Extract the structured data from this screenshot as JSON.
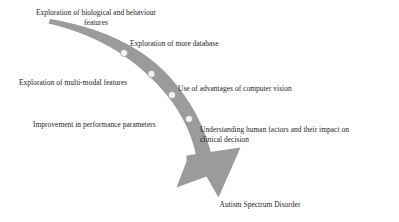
{
  "diagram": {
    "type": "curved-arrow-process",
    "colors": {
      "arrow_band": "#9b9b9b",
      "arrow_band_light": "#b0b0b0",
      "marker_fill": "#f2f2f2",
      "marker_stroke": "#8f8f8f",
      "text": "#1c1c1c",
      "background": "#ffffff"
    },
    "steps": [
      {
        "id": "step-1",
        "label": "Exploration of biological and behaviour\nfeatures",
        "align": "centered",
        "marker": false
      },
      {
        "id": "step-2",
        "label": "Exploration of more database",
        "align": "left",
        "marker": true
      },
      {
        "id": "step-3",
        "label": "Exploration of multi-modal features",
        "align": "left",
        "marker": true
      },
      {
        "id": "step-4",
        "label": "Use of advantages of computer vision",
        "align": "left",
        "marker": true
      },
      {
        "id": "step-5",
        "label": "Improvement in performance parameters",
        "align": "left",
        "marker": true
      },
      {
        "id": "step-6",
        "label": "Understanding human factors and their impact on\nclinical decision",
        "align": "left",
        "marker": true
      }
    ],
    "outcome": {
      "id": "outcome",
      "label": "Autism Spectrum Disorder",
      "align": "centered"
    },
    "markers": [
      {
        "name": "milestone-marker-1",
        "cx": 124,
        "cy": 53,
        "r": 3.6
      },
      {
        "name": "milestone-marker-2",
        "cx": 151.5,
        "cy": 74,
        "r": 3.6
      },
      {
        "name": "milestone-marker-3",
        "cx": 172,
        "cy": 95,
        "r": 3.6
      },
      {
        "name": "milestone-marker-4",
        "cx": 189,
        "cy": 119,
        "r": 3.6
      }
    ]
  }
}
